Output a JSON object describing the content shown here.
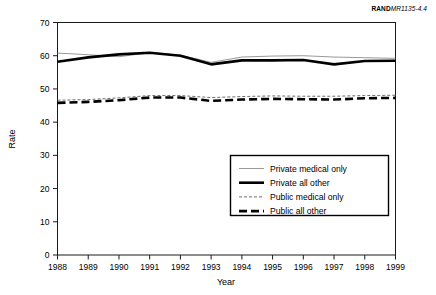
{
  "corner_label": {
    "prefix": "RAND",
    "code": "MR1135-4.4",
    "full": "RANDMR1135-4.4"
  },
  "chart_data": {
    "type": "line",
    "title": "",
    "subtitle": "",
    "xlabel": "Year",
    "ylabel": "Rate",
    "x": [
      1988,
      1989,
      1990,
      1991,
      1992,
      1993,
      1994,
      1995,
      1996,
      1997,
      1998,
      1999
    ],
    "xtick_labels": [
      "1988",
      "1989",
      "1990",
      "1991",
      "1992",
      "1993",
      "1994",
      "1995",
      "1996",
      "1997",
      "1998",
      "1999"
    ],
    "ytick_labels": [
      "0",
      "10",
      "20",
      "30",
      "40",
      "50",
      "60",
      "70"
    ],
    "yticks": [
      0,
      10,
      20,
      30,
      40,
      50,
      60,
      70
    ],
    "ylim": [
      0,
      70
    ],
    "xlim": [
      1988,
      1999
    ],
    "grid": false,
    "legend_position": "center-right-lower",
    "series": [
      {
        "name": "Private medical only",
        "style": "thin-solid",
        "color": "#999999",
        "width": 1.0,
        "dash": "none",
        "values": [
          60.8,
          60.3,
          59.7,
          60.9,
          60.2,
          58.0,
          59.6,
          59.9,
          60.0,
          59.6,
          59.4,
          59.2
        ]
      },
      {
        "name": "Private all other",
        "style": "thick-solid",
        "color": "#000000",
        "width": 2.6,
        "dash": "none",
        "values": [
          58.2,
          59.5,
          60.4,
          60.9,
          60.0,
          57.4,
          58.6,
          58.6,
          58.7,
          57.4,
          58.4,
          58.5
        ]
      },
      {
        "name": "Public medical only",
        "style": "thin-dashed",
        "color": "#6f6f6f",
        "width": 1.0,
        "dash": "3 2",
        "values": [
          46.6,
          46.8,
          47.3,
          48.0,
          48.0,
          47.4,
          47.7,
          47.9,
          47.8,
          47.8,
          48.0,
          48.1
        ]
      },
      {
        "name": "Public all other",
        "style": "thick-dashed",
        "color": "#000000",
        "width": 2.6,
        "dash": "8 4",
        "values": [
          45.8,
          46.1,
          46.6,
          47.4,
          47.4,
          46.4,
          46.8,
          47.0,
          46.9,
          46.8,
          47.2,
          47.3
        ]
      }
    ]
  },
  "legend": {
    "items": [
      {
        "label": "Private medical only"
      },
      {
        "label": "Private all other"
      },
      {
        "label": "Public medical only"
      },
      {
        "label": "Public all other"
      }
    ]
  }
}
